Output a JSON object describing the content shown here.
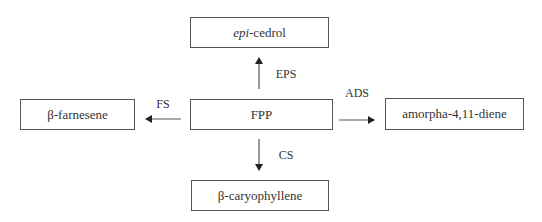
{
  "diagram": {
    "center": {
      "id": "fpp",
      "label": "FPP"
    },
    "nodes": [
      {
        "id": "epi-cedrol",
        "prefix_italic": "epi",
        "label": "-cedrol"
      },
      {
        "id": "beta-farnesene",
        "label": "β-farnesene"
      },
      {
        "id": "amorpha-diene",
        "label": "amorpha-4,11-diene"
      },
      {
        "id": "beta-caryophyllene",
        "label": "β-caryophyllene"
      }
    ],
    "edges": [
      {
        "from": "FPP",
        "to": "epi-cedrol",
        "enzyme": "EPS",
        "direction": "up"
      },
      {
        "from": "FPP",
        "to": "β-farnesene",
        "enzyme": "FS",
        "direction": "left"
      },
      {
        "from": "FPP",
        "to": "amorpha-4,11-diene",
        "enzyme": "ADS",
        "direction": "right"
      },
      {
        "from": "FPP",
        "to": "β-caryophyllene",
        "enzyme": "CS",
        "direction": "down"
      }
    ],
    "colors": {
      "line": "#555555",
      "text": "#333333",
      "background": "#ffffff"
    }
  }
}
